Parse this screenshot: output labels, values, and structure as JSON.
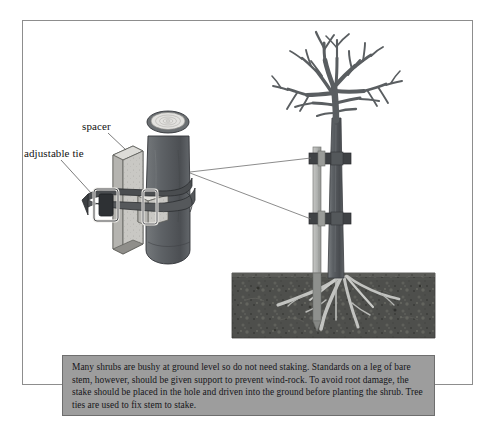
{
  "figure": {
    "background_color": "#ffffff",
    "frame_border_color": "#8d8d8d"
  },
  "labels": [
    {
      "id": "spacer",
      "text": "spacer"
    },
    {
      "id": "adjustable_tie",
      "text": "adjustable tie"
    }
  ],
  "caption": {
    "text": "Many shrubs are bushy at ground level so do not need staking. Standards on a leg of bare stem, however, should be given support to prevent wind-rock. To avoid root damage, the stake should be placed in the hole and driven into the ground before planting the shrub. Tree ties are used to fix stem to stake.",
    "background_color": "#9d9d9d",
    "border_color": "#6e6e6e",
    "text_color": "#16161a"
  },
  "colors": {
    "trunk_dark": "#595d61",
    "trunk_mid": "#6d7175",
    "stake_light": "#b8bab8",
    "stake_shade": "#9a9c9a",
    "spacer_face": "#c9c8c4",
    "spacer_side": "#a3a29e",
    "tie_strap": "#4a4d50",
    "buckle_outline": "#e8e8e6",
    "soil_dark": "#4e4f4c",
    "soil_speckle": "#6a6b66",
    "root_light": "#c4c5c2",
    "leader_line": "#6e6e6e",
    "outline": "#2c2c2c"
  },
  "detail_view": {
    "description": "enlarged cutaway of stake, spacer block and adjustable tie around trunk",
    "parts": [
      "stake-post",
      "spacer-block",
      "tie-strap",
      "tie-buckle",
      "cut-trunk"
    ]
  },
  "tree_view": {
    "description": "bare deciduous standard tree with stake, two ties, roots in soil block",
    "tie_count": 2,
    "parts": [
      "tree-crown",
      "tree-trunk",
      "stake",
      "upper-tie",
      "lower-tie",
      "soil-block",
      "root-system"
    ]
  }
}
